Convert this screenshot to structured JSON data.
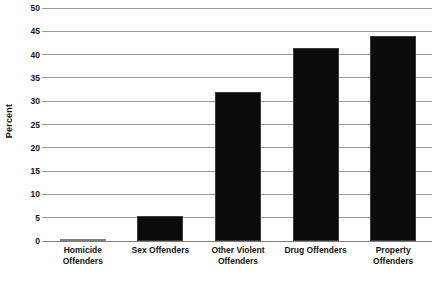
{
  "chart_data": {
    "type": "bar",
    "title": "",
    "subtitle": "",
    "xlabel": "",
    "ylabel": "Percent",
    "ylim": [
      0,
      50
    ],
    "ytick_step": 5,
    "yticks": [
      0,
      5,
      10,
      15,
      20,
      25,
      30,
      35,
      40,
      45,
      50
    ],
    "ytick_labels": [
      "0",
      "5",
      "10",
      "15",
      "20",
      "25",
      "30",
      "35",
      "40",
      "45",
      "50"
    ],
    "grid": true,
    "legend": null,
    "legend_position": "none",
    "bar_color": "#0b0b0b",
    "categories": [
      "Homicide Offenders",
      "Sex Offenders",
      "Other Violent Offenders",
      "Drug Offenders",
      "Property Offenders"
    ],
    "category_lines": [
      [
        "Homicide",
        "Offenders"
      ],
      [
        "Sex Offenders",
        ""
      ],
      [
        "Other Violent",
        "Offenders"
      ],
      [
        "Drug Offenders",
        ""
      ],
      [
        "Property",
        "Offenders"
      ]
    ],
    "values": [
      0.2,
      5.4,
      32.0,
      41.5,
      44.0
    ],
    "annotations": []
  },
  "footer": {
    "smudge_text": ""
  }
}
